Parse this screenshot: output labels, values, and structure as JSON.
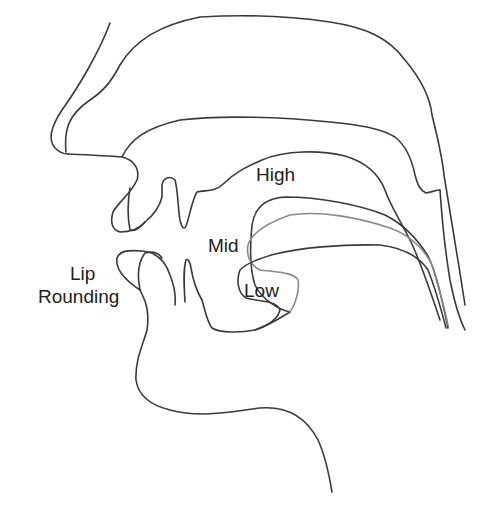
{
  "diagram": {
    "line_color": "#3a3a3a",
    "secondary_line_color": "#8a8a8a",
    "background": "#ffffff",
    "labels": {
      "high": "High",
      "mid": "Mid",
      "low": "Low",
      "lip_line1": "Lip",
      "lip_line2": "Rounding"
    },
    "tongue_positions": [
      {
        "name": "High",
        "stroke": "#3a3a3a"
      },
      {
        "name": "Mid",
        "stroke": "#8a8a8a"
      },
      {
        "name": "Low",
        "stroke": "#3a3a3a"
      }
    ]
  }
}
